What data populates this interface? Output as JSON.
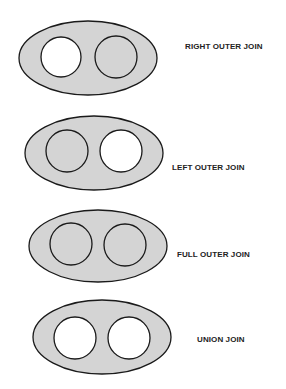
{
  "colors": {
    "shaded": "#d4d4d4",
    "empty": "#ffffff",
    "stroke": "#1a1a1a"
  },
  "diagrams": [
    {
      "label": "RIGHT OUTER JOIN",
      "left_circle": "empty",
      "right_circle": "shaded"
    },
    {
      "label": "LEFT OUTER JOIN",
      "left_circle": "shaded",
      "right_circle": "empty"
    },
    {
      "label": "FULL OUTER JOIN",
      "left_circle": "shaded",
      "right_circle": "shaded"
    },
    {
      "label": "UNION JOIN",
      "left_circle": "empty",
      "right_circle": "empty"
    }
  ]
}
